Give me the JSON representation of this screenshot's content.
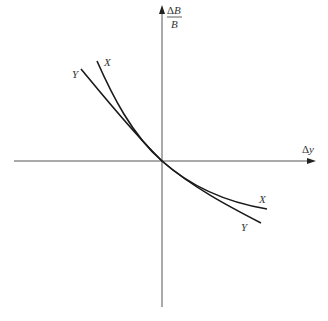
{
  "diagram": {
    "type": "two-curve comparison through origin",
    "axes": {
      "x": {
        "label_delta": "Δ",
        "label_var": "y",
        "direction": "right"
      },
      "y": {
        "numerator_delta": "Δ",
        "numerator_var": "B",
        "denominator": "B",
        "direction": "up"
      },
      "origin": "curves intersect at origin"
    },
    "curves": [
      {
        "name": "X",
        "label_top": "X",
        "label_bottom": "X",
        "description": "downward-sloping convex curve, steeper at upper-left, flatter at lower-right"
      },
      {
        "name": "Y",
        "label_top": "Y",
        "label_bottom": "Y",
        "description": "downward-sloping curve, less convex than X; flatter than X at upper-left, steeper than X at lower-right"
      }
    ],
    "colors": {
      "axis": "#555555",
      "curve": "#1a1a1a",
      "text": "#333333",
      "background": "#ffffff"
    }
  }
}
